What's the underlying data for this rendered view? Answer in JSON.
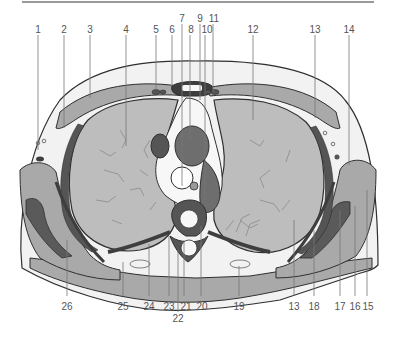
{
  "figure": {
    "type": "anatomical cross-section diagram",
    "colors": {
      "background": "#ffffff",
      "skin_fill": "#f2f2f2",
      "outline": "#2f2f2f",
      "lung": "#bdbdbd",
      "muscle_light": "#a9a9a9",
      "muscle_mid": "#8e8e8e",
      "dark_structure": "#555555",
      "vessel_dark": "#6e6e6e",
      "mediastinum": "#f7f7f7",
      "leader_line": "#777777",
      "label_text": "#555555",
      "top_rule": "#9a9a9a"
    },
    "labels_top": [
      {
        "id": "1",
        "text": "1"
      },
      {
        "id": "2",
        "text": "2"
      },
      {
        "id": "3",
        "text": "3"
      },
      {
        "id": "4",
        "text": "4"
      },
      {
        "id": "5",
        "text": "5"
      },
      {
        "id": "6",
        "text": "6"
      },
      {
        "id": "7",
        "text": "7"
      },
      {
        "id": "8",
        "text": "8"
      },
      {
        "id": "9",
        "text": "9"
      },
      {
        "id": "10",
        "text": "10"
      },
      {
        "id": "11",
        "text": "11"
      },
      {
        "id": "12",
        "text": "12"
      },
      {
        "id": "13a",
        "text": "13"
      },
      {
        "id": "14",
        "text": "14"
      }
    ],
    "labels_bottom": [
      {
        "id": "26",
        "text": "26"
      },
      {
        "id": "25",
        "text": "25"
      },
      {
        "id": "24",
        "text": "24"
      },
      {
        "id": "23",
        "text": "23"
      },
      {
        "id": "22",
        "text": "22"
      },
      {
        "id": "21",
        "text": "21"
      },
      {
        "id": "20",
        "text": "20"
      },
      {
        "id": "19",
        "text": "19"
      },
      {
        "id": "13b",
        "text": "13"
      },
      {
        "id": "18",
        "text": "18"
      },
      {
        "id": "17",
        "text": "17"
      },
      {
        "id": "16",
        "text": "16"
      },
      {
        "id": "15",
        "text": "15"
      }
    ]
  }
}
